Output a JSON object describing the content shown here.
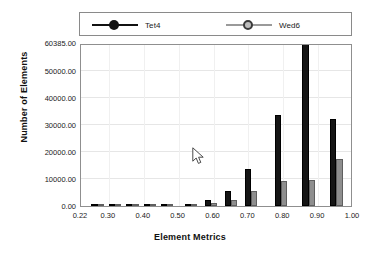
{
  "chart_data": {
    "type": "bar",
    "title": "",
    "subtitle": "",
    "xlabel": "Element Metrics",
    "ylabel": "Number of Elements",
    "xlim": [
      0.22,
      1.0
    ],
    "ylim": [
      0.0,
      60385.0
    ],
    "grid": true,
    "legend_position": "top",
    "xticklabels": [
      "0.22",
      "0.30",
      "0.40",
      "0.50",
      "0.60",
      "0.70",
      "0.80",
      "0.90",
      "1.00"
    ],
    "xtickvalues": [
      0.22,
      0.3,
      0.4,
      0.5,
      0.6,
      0.7,
      0.8,
      0.9,
      1.0
    ],
    "yticklabels": [
      "0.00",
      "10000.00",
      "20000.00",
      "30000.00",
      "40000.00",
      "50000.00",
      "60385.00"
    ],
    "ytickvalues": [
      0,
      10000,
      20000,
      30000,
      40000,
      50000,
      60385
    ],
    "categories": [
      0.25,
      0.3,
      0.35,
      0.4,
      0.45,
      0.5,
      0.55,
      0.6,
      0.65,
      0.7,
      0.75,
      0.8,
      0.85,
      0.9,
      0.95
    ],
    "series": [
      {
        "name": "Tet4",
        "color": "#151515",
        "marker": "filled-circle",
        "values": [
          0,
          60,
          80,
          110,
          180,
          900,
          2300,
          2400,
          5500,
          13800,
          13900,
          33900,
          60385,
          60385,
          32400
        ]
      },
      {
        "name": "Wed6",
        "color": "#8e8e8e",
        "marker": "hollow-circle",
        "values": [
          0,
          40,
          50,
          70,
          110,
          420,
          1100,
          1200,
          2300,
          5600,
          5700,
          9100,
          9800,
          9900,
          17500
        ]
      }
    ],
    "bars": [
      {
        "x_left": 0.518,
        "x_right": 0.553,
        "tet4": 900,
        "wed6": 420
      },
      {
        "x_left": 0.575,
        "x_right": 0.61,
        "tet4": 2300,
        "wed6": 1100
      },
      {
        "x_left": 0.632,
        "x_right": 0.667,
        "tet4": 5500,
        "wed6": 2300
      },
      {
        "x_left": 0.69,
        "x_right": 0.725,
        "tet4": 13800,
        "wed6": 5600
      },
      {
        "x_left": 0.775,
        "x_right": 0.81,
        "tet4": 33900,
        "wed6": 9100
      },
      {
        "x_left": 0.855,
        "x_right": 0.89,
        "tet4": 60385,
        "wed6": 9800
      },
      {
        "x_left": 0.935,
        "x_right": 0.97,
        "tet4": 32400,
        "wed6": 17500
      }
    ]
  },
  "legend": {
    "entries": [
      {
        "label": "Tet4"
      },
      {
        "label": "Wed6"
      }
    ]
  },
  "axes": {
    "x_title": "Element Metrics",
    "y_title": "Number of Elements"
  }
}
